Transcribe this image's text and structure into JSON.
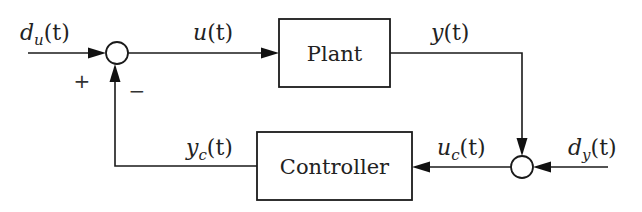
{
  "blocks": {
    "plant": {
      "label": "Plant"
    },
    "controller": {
      "label": "Controller"
    }
  },
  "signals": {
    "du": {
      "base": "d",
      "sub": "u",
      "arg": "(t)"
    },
    "u": {
      "base": "u",
      "sub": "",
      "arg": "(t)"
    },
    "y": {
      "base": "y",
      "sub": "",
      "arg": "(t)"
    },
    "uc": {
      "base": "u",
      "sub": "c",
      "arg": "(t)"
    },
    "dy": {
      "base": "d",
      "sub": "y",
      "arg": "(t)"
    },
    "yc": {
      "base": "y",
      "sub": "c",
      "arg": "(t)"
    }
  },
  "summing_junction_1": {
    "plus_sign": "+",
    "minus_sign": "−"
  },
  "colors": {
    "stroke": "#1a1a1a",
    "background": "#ffffff"
  }
}
